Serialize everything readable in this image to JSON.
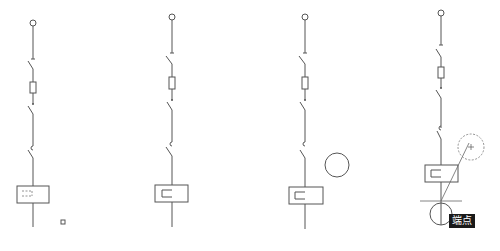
{
  "figure": {
    "panels": [
      {
        "id": 1,
        "has_small_square_marker": true,
        "relay_inner": "dashed"
      },
      {
        "id": 2,
        "relay_inner": "solid-hook"
      },
      {
        "id": 3,
        "relay_inner": "solid-hook",
        "has_circle": true
      },
      {
        "id": 4,
        "relay_inner": "solid-hook",
        "has_dashed_circle": true,
        "has_snap_cursor": true
      }
    ],
    "snap_tooltip": "端点",
    "colors": {
      "line": "#555555",
      "tooltip_bg": "#1a1a1a",
      "tooltip_text": "#ffffff",
      "background": "#ffffff"
    }
  }
}
